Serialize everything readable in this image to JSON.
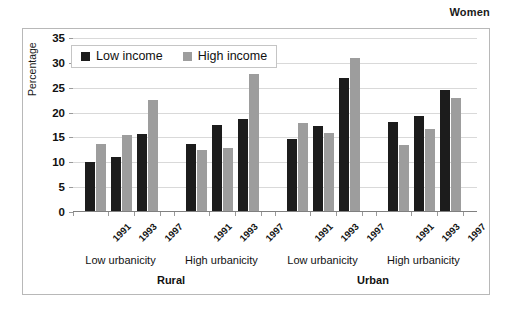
{
  "super_title": "Women",
  "legend": {
    "position": "top-left-inside",
    "items": [
      {
        "label": "Low income",
        "color": "#1c1c1c",
        "key": "low"
      },
      {
        "label": "High income",
        "color": "#9d9d9d",
        "key": "high"
      }
    ]
  },
  "axis": {
    "y_title": "Percentage",
    "y_ticks": [
      "0",
      "5",
      "10",
      "15",
      "20",
      "25",
      "30",
      "35"
    ]
  },
  "groups": [
    {
      "region": "Rural",
      "urbanicity": "Low urbanicity",
      "years": [
        "1991",
        "1993",
        "1997"
      ]
    },
    {
      "region": "Rural",
      "urbanicity": "High urbanicity",
      "years": [
        "1991",
        "1993",
        "1997"
      ]
    },
    {
      "region": "Urban",
      "urbanicity": "Low urbanicity",
      "years": [
        "1991",
        "1993",
        "1997"
      ]
    },
    {
      "region": "Urban",
      "urbanicity": "High urbanicity",
      "years": [
        "1991",
        "1993",
        "1997"
      ]
    }
  ],
  "regions": [
    {
      "label": "Rural"
    },
    {
      "label": "Urban"
    }
  ],
  "chart_data": {
    "type": "bar",
    "title": "Women",
    "xlabel": "",
    "ylabel": "Percentage",
    "ylim": [
      0,
      35
    ],
    "ytick_step": 5,
    "grid": true,
    "legend_position": "upper left (inside plot)",
    "grouping": "region > urbanicity > year",
    "categories": [
      "Rural / Low urbanicity / 1991",
      "Rural / Low urbanicity / 1993",
      "Rural / Low urbanicity / 1997",
      "Rural / High urbanicity / 1991",
      "Rural / High urbanicity / 1993",
      "Rural / High urbanicity / 1997",
      "Urban / Low urbanicity / 1991",
      "Urban / Low urbanicity / 1993",
      "Urban / Low urbanicity / 1997",
      "Urban / High urbanicity / 1991",
      "Urban / High urbanicity / 1993",
      "Urban / High urbanicity / 1997"
    ],
    "series": [
      {
        "name": "Low income",
        "color": "#1c1c1c",
        "values": [
          9.8,
          10.9,
          15.5,
          13.5,
          17.3,
          18.5,
          14.5,
          17.2,
          26.8,
          18.0,
          19.1,
          24.3
        ]
      },
      {
        "name": "High income",
        "color": "#9d9d9d",
        "values": [
          13.5,
          15.2,
          22.3,
          12.3,
          12.7,
          27.6,
          17.7,
          15.6,
          30.8,
          13.3,
          16.4,
          22.7
        ]
      }
    ]
  }
}
